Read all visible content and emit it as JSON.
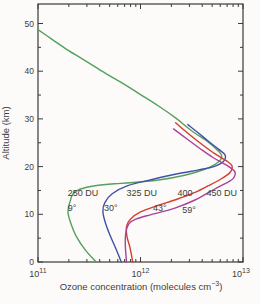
{
  "chart_data": {
    "type": "line",
    "title": "",
    "grid": false,
    "legend_position": "inline-annotations",
    "colors": {
      "axis": "#3a3a3a",
      "text": "#3d3d3d",
      "background": "#fcfbf9"
    },
    "x_axis": {
      "scale": "log",
      "min": 100000000000.0,
      "max": 10000000000000.0,
      "label_pre": "Ozone concentration (molecules cm",
      "label_sup": "−3",
      "label_post": ")",
      "ticks": [
        {
          "base": "10",
          "exp": "11"
        },
        {
          "base": "10",
          "exp": "12"
        },
        {
          "base": "10",
          "exp": "13"
        }
      ],
      "minor_ticks": "log-decade-2-through-9"
    },
    "y_axis": {
      "label": "Altitude (km)",
      "min": 0,
      "max": 54,
      "major": [
        0,
        10,
        20,
        30,
        40,
        50
      ],
      "minor": [
        5,
        15,
        25,
        35,
        45
      ]
    },
    "series": [
      {
        "id": "lat9",
        "name": "9° (250 DU)",
        "latitude": "9°",
        "ozone_column": "250 DU",
        "color": "#55a05c",
        "points": [
          [
            100000000000.0,
            48.7
          ],
          [
            135000000000.0,
            46.8
          ],
          [
            190000000000.0,
            44.6
          ],
          [
            270000000000.0,
            42.6
          ],
          [
            400000000000.0,
            40.3
          ],
          [
            630000000000.0,
            37.8
          ],
          [
            1000000000000.0,
            35.1
          ],
          [
            1500000000000.0,
            32.7
          ],
          [
            2200000000000.0,
            30.2
          ],
          [
            3100000000000.0,
            27.6
          ],
          [
            4400000000000.0,
            25.4
          ],
          [
            5600000000000.0,
            23.5
          ],
          [
            6200000000000.0,
            22.2
          ],
          [
            5700000000000.0,
            20.9
          ],
          [
            4300000000000.0,
            19.5
          ],
          [
            2700000000000.0,
            18.2
          ],
          [
            1500000000000.0,
            17.2
          ],
          [
            800000000000.0,
            16.6
          ],
          [
            560000000000.0,
            16.4
          ],
          [
            360000000000.0,
            16.0
          ],
          [
            260000000000.0,
            15.3
          ],
          [
            220000000000.0,
            14.3
          ],
          [
            205000000000.0,
            12.6
          ],
          [
            196000000000.0,
            10.5
          ],
          [
            210000000000.0,
            8.0
          ],
          [
            235000000000.0,
            5.5
          ],
          [
            290000000000.0,
            2.5
          ],
          [
            370000000000.0,
            0
          ]
        ]
      },
      {
        "id": "lat30",
        "name": "30° (325 DU)",
        "latitude": "30°",
        "ozone_column": "325 DU",
        "color": "#4052a5",
        "points": [
          [
            2900000000000.0,
            28.8
          ],
          [
            3600000000000.0,
            27.2
          ],
          [
            4600000000000.0,
            25.3
          ],
          [
            5800000000000.0,
            23.6
          ],
          [
            6700000000000.0,
            22.4
          ],
          [
            6400000000000.0,
            21.0
          ],
          [
            5200000000000.0,
            20.0
          ],
          [
            3700000000000.0,
            19.3
          ],
          [
            2300000000000.0,
            18.5
          ],
          [
            1300000000000.0,
            17.3
          ],
          [
            750000000000.0,
            16.0
          ],
          [
            530000000000.0,
            14.3
          ],
          [
            450000000000.0,
            12.5
          ],
          [
            430000000000.0,
            10.7
          ],
          [
            450000000000.0,
            8.5
          ],
          [
            500000000000.0,
            5.8
          ],
          [
            570000000000.0,
            3.0
          ],
          [
            650000000000.0,
            0
          ]
        ]
      },
      {
        "id": "lat43",
        "name": "43° (400 DU)",
        "latitude": "43°",
        "ozone_column": "400 DU",
        "color": "#d63c2f",
        "points": [
          [
            2200000000000.0,
            29.2
          ],
          [
            2900000000000.0,
            27.0
          ],
          [
            3900000000000.0,
            24.8
          ],
          [
            5300000000000.0,
            22.7
          ],
          [
            6900000000000.0,
            21.2
          ],
          [
            7800000000000.0,
            20.2
          ],
          [
            7500000000000.0,
            18.8
          ],
          [
            6200000000000.0,
            17.5
          ],
          [
            4600000000000.0,
            16.0
          ],
          [
            3400000000000.0,
            14.6
          ],
          [
            2300000000000.0,
            13.2
          ],
          [
            1500000000000.0,
            11.9
          ],
          [
            1000000000000.0,
            10.5
          ],
          [
            800000000000.0,
            9.0
          ],
          [
            730000000000.0,
            7.4
          ],
          [
            740000000000.0,
            5.2
          ],
          [
            790000000000.0,
            3.0
          ],
          [
            840000000000.0,
            0
          ]
        ]
      },
      {
        "id": "lat59",
        "name": "59° (450 DU)",
        "latitude": "59°",
        "ozone_column": "450 DU",
        "color": "#a8429c",
        "points": [
          [
            2100000000000.0,
            27.9
          ],
          [
            2800000000000.0,
            25.9
          ],
          [
            3800000000000.0,
            23.8
          ],
          [
            5100000000000.0,
            21.9
          ],
          [
            6900000000000.0,
            20.3
          ],
          [
            8300000000000.0,
            19.0
          ],
          [
            8100000000000.0,
            17.6
          ],
          [
            7200000000000.0,
            16.8
          ],
          [
            5200000000000.0,
            15.2
          ],
          [
            3400000000000.0,
            13.0
          ],
          [
            2100000000000.0,
            11.2
          ],
          [
            1250000000000.0,
            9.9
          ],
          [
            900000000000.0,
            9.0
          ],
          [
            770000000000.0,
            8.0
          ],
          [
            720000000000.0,
            6.2
          ],
          [
            710000000000.0,
            3.6
          ],
          [
            730000000000.0,
            0
          ]
        ]
      }
    ],
    "annotations": [
      {
        "text": "250 DU",
        "conc": 195000000000.0,
        "alt": 13.9
      },
      {
        "text": "325 DU",
        "conc": 730000000000.0,
        "alt": 13.9
      },
      {
        "text": "400",
        "conc": 2300000000000.0,
        "alt": 13.9
      },
      {
        "text": "450 DU",
        "conc": 4400000000000.0,
        "alt": 13.9
      },
      {
        "text": "9°",
        "conc": 195000000000.0,
        "alt": 10.6
      },
      {
        "text": "30°",
        "conc": 440000000000.0,
        "alt": 10.6
      },
      {
        "text": "43°",
        "conc": 1320000000000.0,
        "alt": 10.6
      },
      {
        "text": "59°",
        "conc": 2550000000000.0,
        "alt": 10.2
      }
    ]
  }
}
